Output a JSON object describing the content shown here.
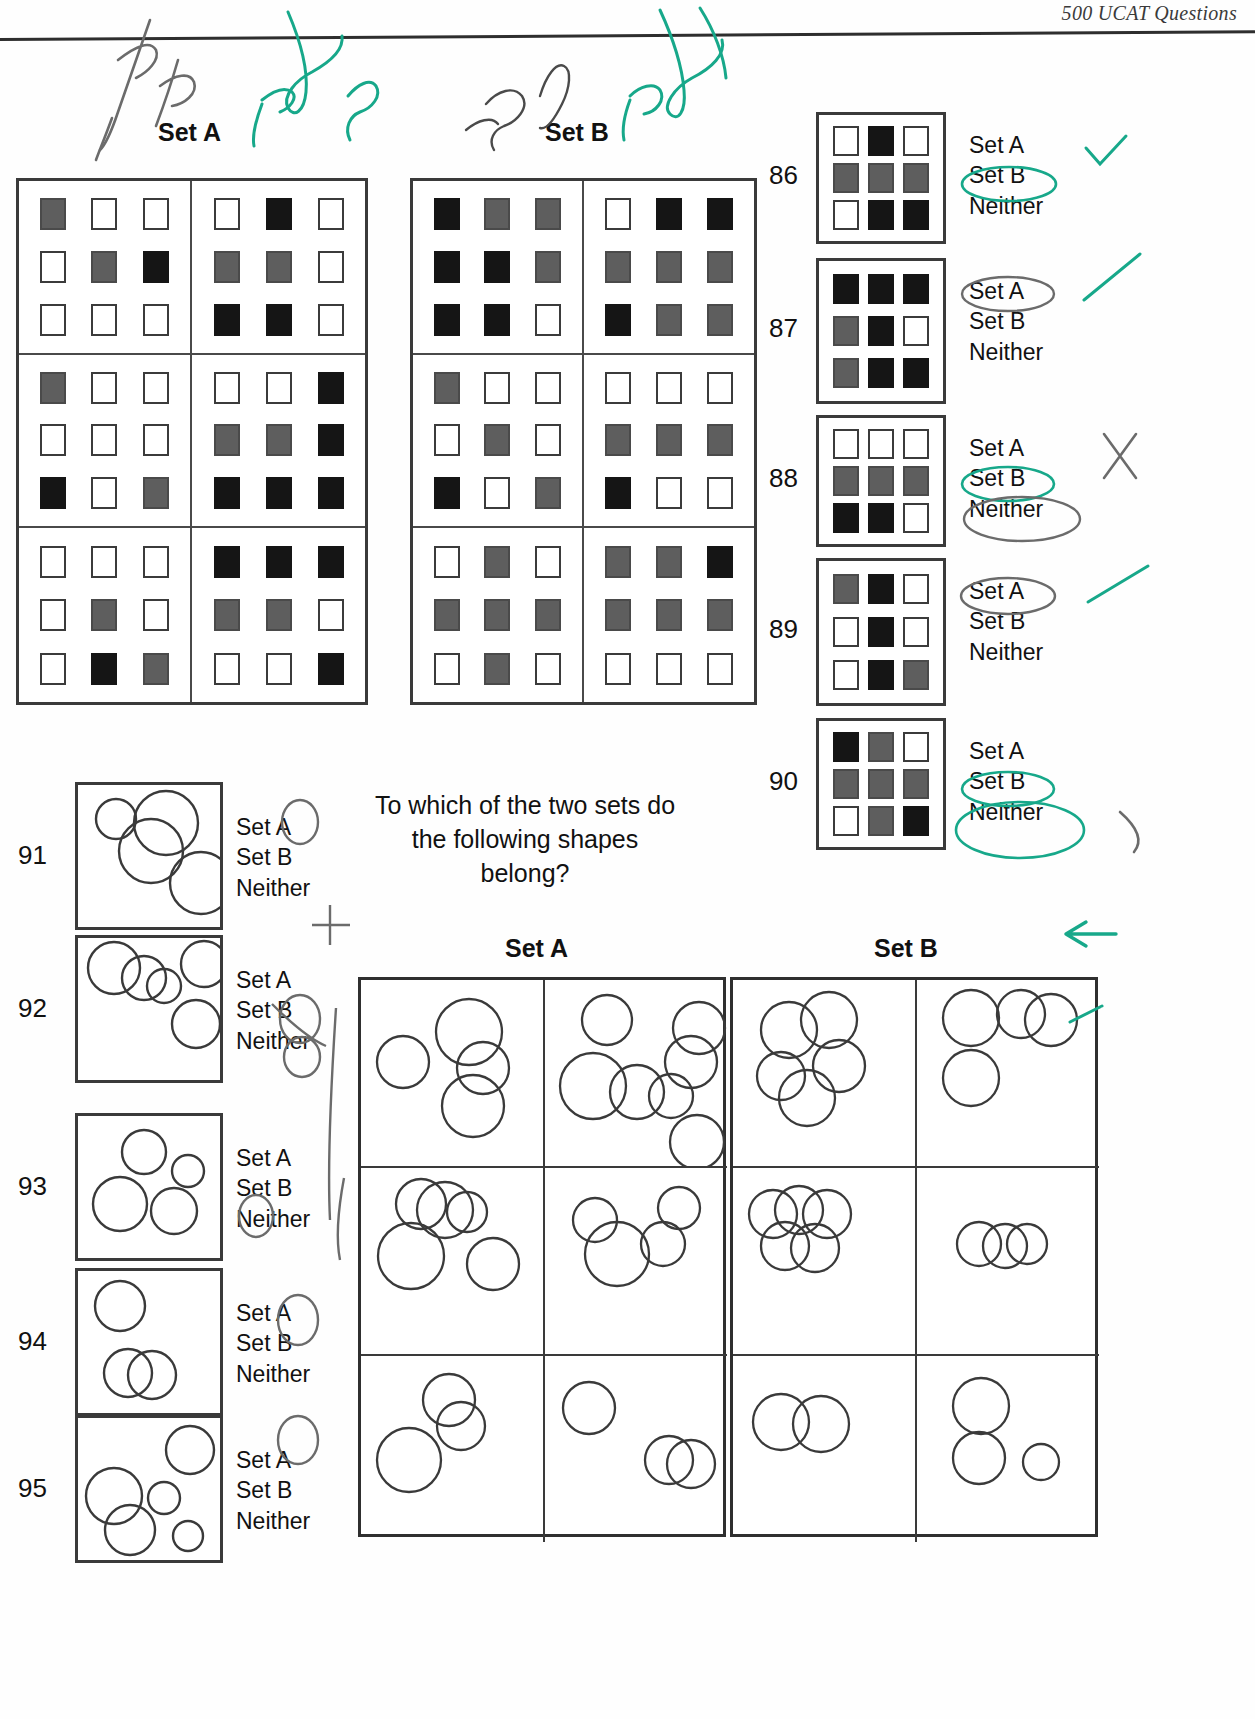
{
  "header": {
    "running_title": "500 UCAT Questions"
  },
  "labels": {
    "set_a": "Set A",
    "set_b": "Set B"
  },
  "prompt": {
    "line1": "To which of the two sets do",
    "line2": "the following shapes",
    "line3": "belong?"
  },
  "options": {
    "set_a": "Set A",
    "set_b": "Set B",
    "neither": "Neither"
  },
  "colors": {
    "white": "#ffffff",
    "grey": "#5e5e5e",
    "black": "#151515",
    "ink_green": "#17a88a",
    "ink_pencil": "#6b6b6b",
    "rule": "#2e2e2e"
  },
  "squares_set_a": {
    "title": "Set A",
    "cells": [
      [
        [
          "grey",
          "white",
          "white"
        ],
        [
          "white",
          "grey",
          "black"
        ],
        [
          "white",
          "white",
          "white"
        ]
      ],
      [
        [
          "white",
          "black",
          "white"
        ],
        [
          "grey",
          "grey",
          "white"
        ],
        [
          "black",
          "black",
          "white"
        ]
      ],
      [
        [
          "grey",
          "white",
          "white"
        ],
        [
          "white",
          "white",
          "white"
        ],
        [
          "black",
          "white",
          "grey"
        ]
      ],
      [
        [
          "white",
          "white",
          "black"
        ],
        [
          "grey",
          "grey",
          "black"
        ],
        [
          "black",
          "black",
          "black"
        ]
      ],
      [
        [
          "white",
          "white",
          "white"
        ],
        [
          "white",
          "grey",
          "white"
        ],
        [
          "white",
          "black",
          "grey"
        ]
      ],
      [
        [
          "black",
          "black",
          "black"
        ],
        [
          "grey",
          "grey",
          "white"
        ],
        [
          "white",
          "white",
          "black"
        ]
      ]
    ]
  },
  "squares_set_b": {
    "title": "Set B",
    "cells": [
      [
        [
          "black",
          "grey",
          "grey"
        ],
        [
          "black",
          "black",
          "grey"
        ],
        [
          "black",
          "black",
          "white"
        ]
      ],
      [
        [
          "white",
          "black",
          "black"
        ],
        [
          "grey",
          "grey",
          "grey"
        ],
        [
          "black",
          "grey",
          "grey"
        ]
      ],
      [
        [
          "grey",
          "white",
          "white"
        ],
        [
          "white",
          "grey",
          "white"
        ],
        [
          "black",
          "white",
          "grey"
        ]
      ],
      [
        [
          "white",
          "white",
          "white"
        ],
        [
          "grey",
          "grey",
          "grey"
        ],
        [
          "black",
          "white",
          "white"
        ]
      ],
      [
        [
          "white",
          "grey",
          "white"
        ],
        [
          "grey",
          "grey",
          "grey"
        ],
        [
          "white",
          "grey",
          "white"
        ]
      ],
      [
        [
          "grey",
          "grey",
          "black"
        ],
        [
          "grey",
          "grey",
          "grey"
        ],
        [
          "white",
          "white",
          "white"
        ]
      ]
    ]
  },
  "square_questions": [
    {
      "number": "86",
      "grid": [
        [
          "white",
          "black",
          "white"
        ],
        [
          "grey",
          "grey",
          "grey"
        ],
        [
          "white",
          "black",
          "black"
        ]
      ],
      "options": [
        "Set A",
        "Set B",
        "Neither"
      ],
      "marked": "Set B"
    },
    {
      "number": "87",
      "grid": [
        [
          "black",
          "black",
          "black"
        ],
        [
          "grey",
          "black",
          "white"
        ],
        [
          "grey",
          "black",
          "black"
        ]
      ],
      "options": [
        "Set A",
        "Set B",
        "Neither"
      ],
      "marked": "Set A"
    },
    {
      "number": "88",
      "grid": [
        [
          "white",
          "white",
          "white"
        ],
        [
          "grey",
          "grey",
          "grey"
        ],
        [
          "black",
          "black",
          "white"
        ]
      ],
      "options": [
        "Set A",
        "Set B",
        "Neither"
      ],
      "marked": "Set B and Neither"
    },
    {
      "number": "89",
      "grid": [
        [
          "grey",
          "black",
          "white"
        ],
        [
          "white",
          "black",
          "white"
        ],
        [
          "white",
          "black",
          "grey"
        ]
      ],
      "options": [
        "Set A",
        "Set B",
        "Neither"
      ],
      "marked": "Set A"
    },
    {
      "number": "90",
      "grid": [
        [
          "black",
          "grey",
          "white"
        ],
        [
          "grey",
          "grey",
          "grey"
        ],
        [
          "white",
          "grey",
          "black"
        ]
      ],
      "options": [
        "Set A",
        "Set B",
        "Neither"
      ],
      "marked": "Set B and Neither"
    }
  ],
  "circle_questions": [
    {
      "number": "91",
      "circles": [
        {
          "cx": 38,
          "cy": 34,
          "r": 20
        },
        {
          "cx": 88,
          "cy": 38,
          "r": 32
        },
        {
          "cx": 73,
          "cy": 66,
          "r": 32
        },
        {
          "cx": 123,
          "cy": 98,
          "r": 31
        }
      ],
      "options": [
        "Set A",
        "Set B",
        "Neither"
      ],
      "marked": "Set A"
    },
    {
      "number": "92",
      "circles": [
        {
          "cx": 36,
          "cy": 30,
          "r": 26
        },
        {
          "cx": 66,
          "cy": 40,
          "r": 22
        },
        {
          "cx": 86,
          "cy": 48,
          "r": 17
        },
        {
          "cx": 126,
          "cy": 26,
          "r": 23
        },
        {
          "cx": 118,
          "cy": 86,
          "r": 24
        }
      ],
      "options": [
        "Set A",
        "Set B",
        "Neither"
      ],
      "marked": "Set A and Set B"
    },
    {
      "number": "93",
      "circles": [
        {
          "cx": 66,
          "cy": 36,
          "r": 22
        },
        {
          "cx": 110,
          "cy": 55,
          "r": 16
        },
        {
          "cx": 42,
          "cy": 88,
          "r": 27
        },
        {
          "cx": 96,
          "cy": 95,
          "r": 23
        }
      ],
      "options": [
        "Set A",
        "Set B",
        "Neither"
      ],
      "marked": "Neither"
    },
    {
      "number": "94",
      "circles": [
        {
          "cx": 42,
          "cy": 35,
          "r": 25
        },
        {
          "cx": 50,
          "cy": 102,
          "r": 24
        },
        {
          "cx": 74,
          "cy": 104,
          "r": 24
        }
      ],
      "options": [
        "Set A",
        "Set B",
        "Neither"
      ],
      "marked": "Set A"
    },
    {
      "number": "95",
      "circles": [
        {
          "cx": 112,
          "cy": 32,
          "r": 24
        },
        {
          "cx": 36,
          "cy": 78,
          "r": 28
        },
        {
          "cx": 86,
          "cy": 80,
          "r": 16
        },
        {
          "cx": 52,
          "cy": 112,
          "r": 25
        },
        {
          "cx": 110,
          "cy": 118,
          "r": 15
        }
      ],
      "options": [
        "Set A",
        "Set B",
        "Neither"
      ],
      "marked": "Set A"
    }
  ],
  "circles_set_a": {
    "title": "Set A",
    "cells": [
      [
        {
          "cx": 42,
          "cy": 82,
          "r": 26
        },
        {
          "cx": 108,
          "cy": 52,
          "r": 33
        },
        {
          "cx": 122,
          "cy": 88,
          "r": 26
        },
        {
          "cx": 112,
          "cy": 126,
          "r": 31
        }
      ],
      [
        {
          "cx": 62,
          "cy": 40,
          "r": 25
        },
        {
          "cx": 154,
          "cy": 48,
          "r": 26
        },
        {
          "cx": 146,
          "cy": 82,
          "r": 26
        },
        {
          "cx": 48,
          "cy": 106,
          "r": 33
        },
        {
          "cx": 92,
          "cy": 112,
          "r": 27
        },
        {
          "cx": 126,
          "cy": 116,
          "r": 22
        },
        {
          "cx": 152,
          "cy": 162,
          "r": 27
        }
      ],
      [
        {
          "cx": 50,
          "cy": 88,
          "r": 33
        },
        {
          "cx": 106,
          "cy": 44,
          "r": 20
        },
        {
          "cx": 60,
          "cy": 36,
          "r": 25
        },
        {
          "cx": 84,
          "cy": 42,
          "r": 28
        },
        {
          "cx": 132,
          "cy": 96,
          "r": 26
        }
      ],
      [
        {
          "cx": 72,
          "cy": 86,
          "r": 32
        },
        {
          "cx": 118,
          "cy": 76,
          "r": 22
        },
        {
          "cx": 50,
          "cy": 52,
          "r": 22
        },
        {
          "cx": 134,
          "cy": 40,
          "r": 21
        }
      ],
      [
        {
          "cx": 88,
          "cy": 44,
          "r": 26
        },
        {
          "cx": 100,
          "cy": 70,
          "r": 24
        },
        {
          "cx": 48,
          "cy": 104,
          "r": 32
        }
      ],
      [
        {
          "cx": 44,
          "cy": 52,
          "r": 26
        },
        {
          "cx": 124,
          "cy": 104,
          "r": 24
        },
        {
          "cx": 146,
          "cy": 108,
          "r": 24
        }
      ]
    ]
  },
  "circles_set_b": {
    "title": "Set B",
    "cells": [
      [
        {
          "cx": 56,
          "cy": 50,
          "r": 28
        },
        {
          "cx": 96,
          "cy": 40,
          "r": 28
        },
        {
          "cx": 48,
          "cy": 96,
          "r": 24
        },
        {
          "cx": 74,
          "cy": 118,
          "r": 28
        },
        {
          "cx": 106,
          "cy": 86,
          "r": 26
        }
      ],
      [
        {
          "cx": 54,
          "cy": 38,
          "r": 28
        },
        {
          "cx": 104,
          "cy": 34,
          "r": 24
        },
        {
          "cx": 134,
          "cy": 40,
          "r": 26
        },
        {
          "cx": 54,
          "cy": 98,
          "r": 28
        }
      ],
      [
        {
          "cx": 40,
          "cy": 46,
          "r": 24
        },
        {
          "cx": 66,
          "cy": 42,
          "r": 24
        },
        {
          "cx": 94,
          "cy": 46,
          "r": 24
        },
        {
          "cx": 52,
          "cy": 78,
          "r": 24
        },
        {
          "cx": 82,
          "cy": 80,
          "r": 24
        }
      ],
      [
        {
          "cx": 62,
          "cy": 76,
          "r": 22
        },
        {
          "cx": 88,
          "cy": 78,
          "r": 22
        },
        {
          "cx": 110,
          "cy": 76,
          "r": 20
        }
      ],
      [
        {
          "cx": 48,
          "cy": 66,
          "r": 28
        },
        {
          "cx": 88,
          "cy": 68,
          "r": 28
        }
      ],
      [
        {
          "cx": 64,
          "cy": 50,
          "r": 28
        },
        {
          "cx": 62,
          "cy": 102,
          "r": 26
        },
        {
          "cx": 124,
          "cy": 106,
          "r": 18
        }
      ]
    ]
  },
  "annotations": {
    "top_left_1": "4x grey",
    "top_left_2": "1 x b",
    "top_left_3": "2x one",
    "top_mid_1": "1 sq",
    "top_mid_2": "2 grey",
    "top_mid_3": "2x grey"
  }
}
